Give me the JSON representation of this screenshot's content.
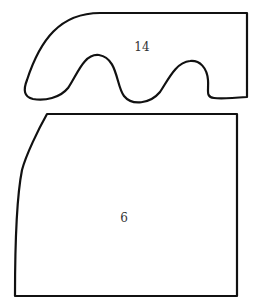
{
  "diagram": {
    "background": "#ffffff",
    "stroke_color": "#111111",
    "shapes": [
      {
        "id": "shape-top",
        "label": "14",
        "kind": "wavy-bottom region"
      },
      {
        "id": "shape-bottom",
        "label": "6",
        "kind": "quadrilateral with curved left edge"
      }
    ]
  }
}
